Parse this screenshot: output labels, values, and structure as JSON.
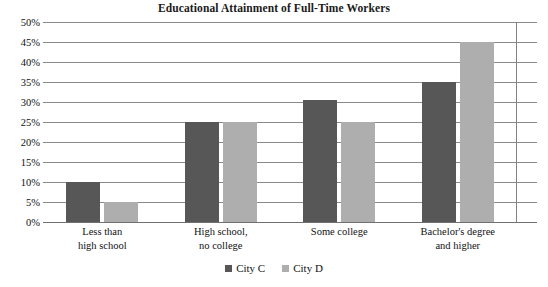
{
  "chart_data": {
    "type": "bar",
    "title": "Educational Attainment of Full-Time Workers",
    "xlabel": "",
    "ylabel": "",
    "ylim": [
      0,
      50
    ],
    "ytick_step": 5,
    "ytick_labels": [
      "50%",
      "45%",
      "40%",
      "35%",
      "30%",
      "25%",
      "20%",
      "15%",
      "10%",
      "5%",
      "0%"
    ],
    "grid": true,
    "legend_position": "bottom-center",
    "categories": [
      "Less than high school",
      "High school, no college",
      "Some college",
      "Bachelor's degree and higher"
    ],
    "category_lines": [
      [
        "Less than",
        "high school"
      ],
      [
        "High school,",
        "no college"
      ],
      [
        "Some college",
        ""
      ],
      [
        "Bachelor's degree",
        "and higher"
      ]
    ],
    "series": [
      {
        "name": "City C",
        "color": "#575757",
        "values": [
          10,
          25,
          30.5,
          35
        ]
      },
      {
        "name": "City D",
        "color": "#aeaeae",
        "values": [
          5,
          25,
          25,
          45
        ]
      }
    ]
  },
  "colors": {
    "series_c": "#575757",
    "series_d": "#aeaeae",
    "gridline": "#8a8a8a",
    "text": "#111111",
    "background": "#ffffff"
  }
}
